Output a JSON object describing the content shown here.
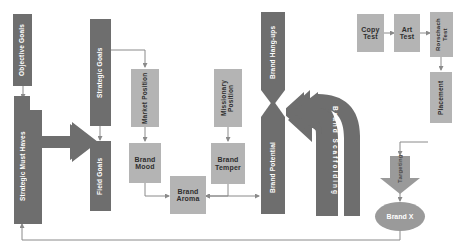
{
  "diagram": {
    "colors": {
      "dark_fill": "#6e6e6e",
      "light_fill": "#b4b4b4",
      "ellipse_fill": "#9a9a9a",
      "line": "#8a8a8a",
      "dark_text": "#ffffff",
      "light_text": "#2e2e2e",
      "background": "#ffffff"
    },
    "nodes": {
      "objective_goals": "Objective Goals",
      "strategic_must_haves": "Strategic Must Haves",
      "strategic_goals": "Strategic Goals",
      "field_goals": "Field Goals",
      "market_position": "Market Position",
      "brand_mood": "Brand Mood",
      "brand_aroma": "Brand Aroma",
      "missionary_position": "Missionary Position",
      "brand_temper": "Brand Temper",
      "brand_hang_ups": "Brand Hang-ups",
      "brand_potential": "Brand Potential",
      "brand_scaffolding": "Brand Scaffolding",
      "copy_test": "Copy Test",
      "art_test": "Art Test",
      "rorschach_test": "Rorschach Test",
      "placement": "Placement",
      "targeting": "Targeting",
      "brand_x": "Brand X"
    },
    "shapes": {
      "objective_goals": "rectangle",
      "strategic_must_haves": "rectangle",
      "strategic_goals": "rectangle",
      "field_goals": "rectangle",
      "market_position": "rectangle",
      "brand_mood": "rectangle",
      "brand_aroma": "rectangle",
      "missionary_position": "rectangle",
      "brand_temper": "rectangle",
      "brand_hang_ups": "down-arrow",
      "brand_potential": "up-arrow",
      "brand_scaffolding": "bent-left-arrow",
      "copy_test": "rectangle",
      "art_test": "rectangle",
      "rorschach_test": "rectangle",
      "placement": "rectangle",
      "targeting": "down-arrow",
      "brand_x": "ellipse"
    },
    "connections": [
      "Objective Goals -> Strategic Must Haves",
      "Strategic Must Haves -> Strategic Goals",
      "Strategic Goals -> Field Goals",
      "Strategic Goals -> Market Position",
      "Market Position -> Brand Mood",
      "Brand Mood -> Brand Aroma",
      "Missionary Position -> Brand Temper",
      "Brand Temper -> Brand Aroma",
      "Brand Aroma <-> Brand Potential",
      "Brand Hang-ups -> Brand Potential",
      "Brand Scaffolding -> Brand Hang-ups",
      "Copy Test -> Art Test",
      "Art Test -> Rorschach Test",
      "Rorschach Test -> Placement",
      "Placement -> Targeting",
      "Targeting -> Brand X",
      "Brand X -> Strategic Must Haves (feedback loop)"
    ]
  }
}
